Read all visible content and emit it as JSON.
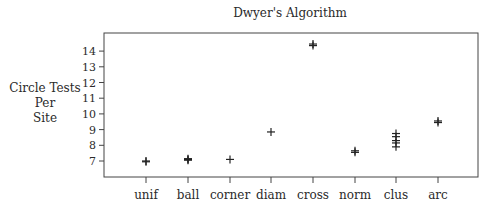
{
  "chart_data": {
    "type": "scatter",
    "title": "Dwyer's Algorithm",
    "xlabel": "",
    "ylabel": [
      "Circle Tests",
      "Per",
      "Site"
    ],
    "categories": [
      "unif",
      "ball",
      "corner",
      "diam",
      "cross",
      "norm",
      "clus",
      "arc"
    ],
    "series": [
      {
        "name": "circle_tests_per_site",
        "marker": "+",
        "points": [
          {
            "category": "unif",
            "values": [
              6.95,
              7.0
            ]
          },
          {
            "category": "ball",
            "values": [
              7.05,
              7.1,
              7.15
            ]
          },
          {
            "category": "corner",
            "values": [
              7.1
            ]
          },
          {
            "category": "diam",
            "values": [
              8.85
            ]
          },
          {
            "category": "cross",
            "values": [
              14.35,
              14.45
            ]
          },
          {
            "category": "norm",
            "values": [
              7.55,
              7.65
            ]
          },
          {
            "category": "clus",
            "values": [
              7.9,
              8.15,
              8.3,
              8.55,
              8.75
            ]
          },
          {
            "category": "arc",
            "values": [
              9.45,
              9.55
            ]
          }
        ]
      }
    ],
    "yticks": [
      7,
      8,
      9,
      10,
      11,
      12,
      13,
      14
    ],
    "ylim": [
      6.0,
      15.2
    ],
    "grid": false,
    "legend": "none"
  }
}
